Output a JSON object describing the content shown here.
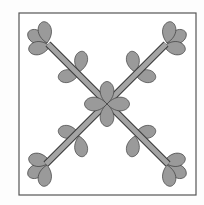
{
  "figure": {
    "colors": {
      "background": "#fdfdfd",
      "frame_stroke": "#555555",
      "leaf_fill": "#9a9a9a",
      "leaf_stroke": "#3a3a3a",
      "stem_fill": "#a4a4a4"
    }
  }
}
